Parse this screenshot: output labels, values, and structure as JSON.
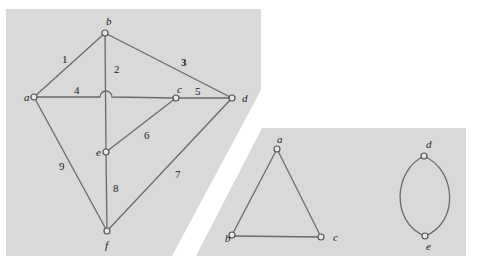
{
  "figure": {
    "colors": {
      "panel": "#d9d9d9",
      "edge": "#6a6a6a",
      "vertex_fill": "#e6e6e6",
      "vertex_stroke": "#555555",
      "text": "#222222"
    },
    "left_graph": {
      "vertices": [
        {
          "id": "a",
          "label": "a",
          "x": 34,
          "y": 97
        },
        {
          "id": "b",
          "label": "b",
          "x": 105,
          "y": 33
        },
        {
          "id": "c",
          "label": "c",
          "x": 176,
          "y": 98
        },
        {
          "id": "d",
          "label": "d",
          "x": 232,
          "y": 98
        },
        {
          "id": "e",
          "label": "e",
          "x": 106,
          "y": 152
        },
        {
          "id": "f",
          "label": "f",
          "x": 107,
          "y": 231
        }
      ],
      "edges": [
        {
          "label": "1",
          "from": "a",
          "to": "b"
        },
        {
          "label": "2",
          "from": "b",
          "to": "e"
        },
        {
          "label": "3",
          "from": "b",
          "to": "d"
        },
        {
          "label": "4",
          "from": "a",
          "to": "c"
        },
        {
          "label": "5",
          "from": "c",
          "to": "d"
        },
        {
          "label": "6",
          "from": "e",
          "to": "c"
        },
        {
          "label": "7",
          "from": "d",
          "to": "f"
        },
        {
          "label": "8",
          "from": "e",
          "to": "f"
        },
        {
          "label": "9",
          "from": "a",
          "to": "f"
        }
      ]
    },
    "right_graph": {
      "vertices": [
        {
          "id": "a",
          "label": "a",
          "x": 277,
          "y": 149
        },
        {
          "id": "b",
          "label": "b",
          "x": 232,
          "y": 235
        },
        {
          "id": "c",
          "label": "c",
          "x": 321,
          "y": 237
        },
        {
          "id": "d",
          "label": "d",
          "x": 424,
          "y": 156
        },
        {
          "id": "e",
          "label": "e",
          "x": 425,
          "y": 236
        }
      ],
      "edges": [
        {
          "from": "a",
          "to": "b"
        },
        {
          "from": "a",
          "to": "c"
        },
        {
          "from": "b",
          "to": "c"
        },
        {
          "from": "d",
          "to": "e",
          "curve": "left"
        },
        {
          "from": "d",
          "to": "e",
          "curve": "right"
        }
      ]
    }
  }
}
